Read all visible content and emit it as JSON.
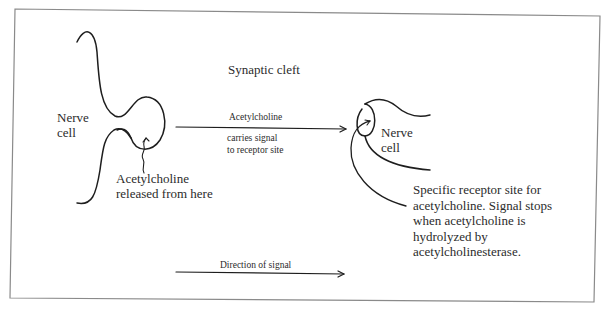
{
  "diagram": {
    "type": "synapse-schematic",
    "frame": {
      "border_color": "#8a8a8a",
      "stroke_color": "#1e1e1e"
    },
    "labels": {
      "synaptic_cleft": "Synaptic cleft",
      "presynaptic_cell": "Nerve\ncell",
      "postsynaptic_cell": "Nerve\ncell",
      "acetylcholine_arrow_top": "Acetylcholine",
      "acetylcholine_arrow_bottom": "carries signal\nto receptor site",
      "release_site": "Acetylcholine\nreleased from here",
      "receptor_site": "Specific receptor site for\nacetylcholine. Signal stops\nwhen acetylcholine is\nhydrolyzed by\nacetylcholinesterase.",
      "direction": "Direction of signal"
    },
    "nodes": [
      {
        "id": "presynaptic-nerve-cell",
        "label": "Nerve cell",
        "position": "left"
      },
      {
        "id": "synaptic-cleft",
        "label": "Synaptic cleft",
        "position": "center"
      },
      {
        "id": "postsynaptic-nerve-cell",
        "label": "Nerve cell",
        "position": "right"
      }
    ],
    "edges": [
      {
        "from": "presynaptic-nerve-cell",
        "to": "postsynaptic-nerve-cell",
        "label": "Acetylcholine carries signal to receptor site"
      },
      {
        "from": "left",
        "to": "right",
        "label": "Direction of signal"
      }
    ]
  }
}
